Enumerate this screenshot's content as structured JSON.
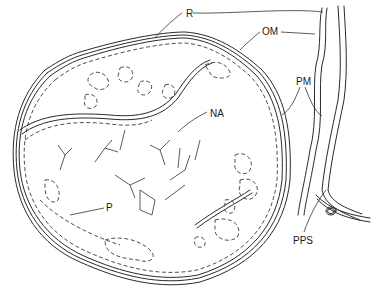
{
  "diagram": {
    "type": "anatomical line drawing",
    "labels": [
      {
        "id": "R",
        "text": "R",
        "x": 186,
        "y": 9
      },
      {
        "id": "OM",
        "text": "OM",
        "x": 265,
        "y": 29
      },
      {
        "id": "PM",
        "text": "PM",
        "x": 296,
        "y": 77
      },
      {
        "id": "NA",
        "text": "NA",
        "x": 211,
        "y": 109
      },
      {
        "id": "P",
        "text": "P",
        "x": 107,
        "y": 203
      },
      {
        "id": "PPS",
        "text": "PPS",
        "x": 295,
        "y": 236
      }
    ]
  }
}
